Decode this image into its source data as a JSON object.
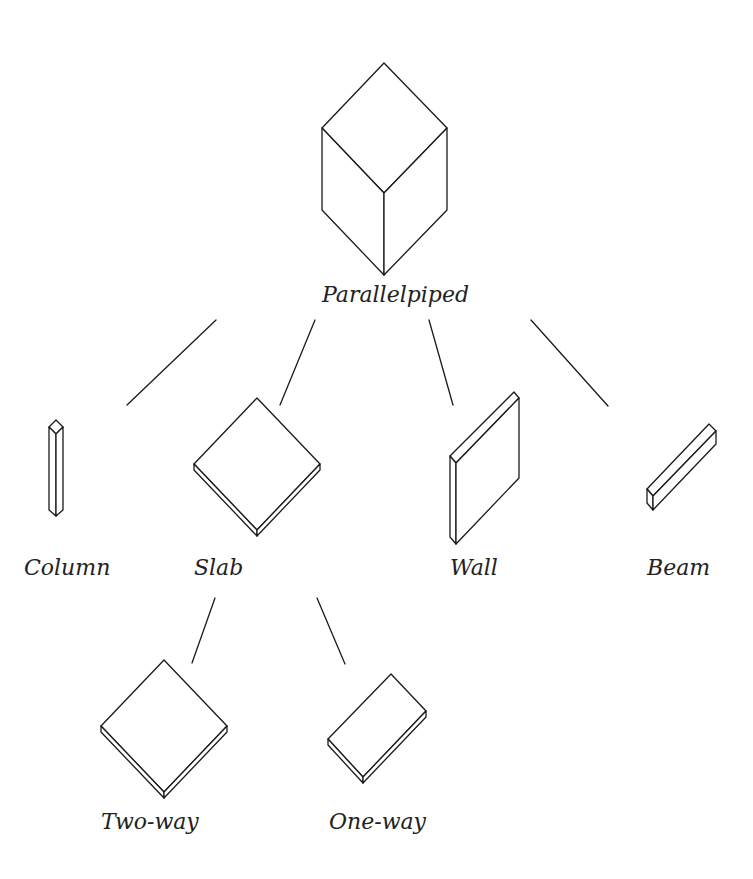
{
  "diagram": {
    "type": "hierarchy",
    "root": {
      "label": "Parallelpiped",
      "shape": "cube-icon",
      "children": [
        {
          "label": "Column",
          "shape": "column-icon"
        },
        {
          "label": "Slab",
          "shape": "slab-icon",
          "children": [
            {
              "label": "Two-way",
              "shape": "two-way-slab-icon"
            },
            {
              "label": "One-way",
              "shape": "one-way-slab-icon"
            }
          ]
        },
        {
          "label": "Wall",
          "shape": "wall-icon"
        },
        {
          "label": "Beam",
          "shape": "beam-icon"
        }
      ]
    }
  },
  "labels": {
    "parallelpiped": "Parallelpiped",
    "column": "Column",
    "slab": "Slab",
    "wall": "Wall",
    "beam": "Beam",
    "two_way": "Two-way",
    "one_way": "One-way"
  },
  "colors": {
    "stroke": "#1a1a1a",
    "text": "#222222",
    "background": "#ffffff"
  }
}
